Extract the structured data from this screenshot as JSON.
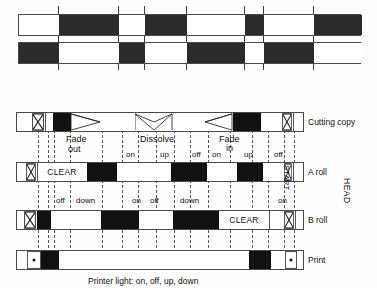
{
  "figure": {
    "caption": "Printer light: on, off, up, down",
    "head_label": "HEAD",
    "start_label": "START"
  },
  "top_strips": {
    "rule_positions": [
      58,
      118,
      144,
      186,
      244,
      263,
      313
    ],
    "strip_a": {
      "segments": [
        {
          "x": 18,
          "w": 40,
          "fill": "white"
        },
        {
          "x": 58,
          "w": 60,
          "fill": "black"
        },
        {
          "x": 118,
          "w": 26,
          "fill": "white"
        },
        {
          "x": 144,
          "w": 42,
          "fill": "black"
        },
        {
          "x": 186,
          "w": 58,
          "fill": "white"
        },
        {
          "x": 244,
          "w": 19,
          "fill": "black"
        },
        {
          "x": 263,
          "w": 50,
          "fill": "white"
        },
        {
          "x": 313,
          "w": 48,
          "fill": "black"
        }
      ]
    },
    "strip_b": {
      "segments": [
        {
          "x": 18,
          "w": 40,
          "fill": "black"
        },
        {
          "x": 58,
          "w": 60,
          "fill": "white"
        },
        {
          "x": 118,
          "w": 26,
          "fill": "black"
        },
        {
          "x": 144,
          "w": 42,
          "fill": "white"
        },
        {
          "x": 186,
          "w": 58,
          "fill": "black"
        },
        {
          "x": 244,
          "w": 19,
          "fill": "white"
        },
        {
          "x": 263,
          "w": 50,
          "fill": "black"
        },
        {
          "x": 313,
          "w": 48,
          "fill": "white"
        }
      ]
    }
  },
  "tracks": [
    {
      "id": "cutting-copy",
      "label": "Cutting copy",
      "cells": [
        {
          "x": 0,
          "w": 14,
          "fill": "white"
        },
        {
          "x": 14,
          "w": 14,
          "fill": "white",
          "marker": "x"
        },
        {
          "x": 28,
          "w": 8,
          "fill": "white"
        },
        {
          "x": 36,
          "w": 18,
          "fill": "black"
        },
        {
          "x": 54,
          "w": 30,
          "fill": "white",
          "marker": "fade-out"
        },
        {
          "x": 84,
          "w": 34,
          "fill": "white"
        },
        {
          "x": 118,
          "w": 38,
          "fill": "white",
          "marker": "dissolve"
        },
        {
          "x": 156,
          "w": 32,
          "fill": "white"
        },
        {
          "x": 188,
          "w": 28,
          "fill": "white",
          "marker": "fade-in"
        },
        {
          "x": 216,
          "w": 28,
          "fill": "black"
        },
        {
          "x": 244,
          "w": 20,
          "fill": "white"
        },
        {
          "x": 264,
          "w": 12,
          "fill": "white",
          "marker": "x"
        },
        {
          "x": 276,
          "w": 12,
          "fill": "white"
        }
      ]
    },
    {
      "id": "a-roll",
      "label": "A roll",
      "cells": [
        {
          "x": 0,
          "w": 8,
          "fill": "white"
        },
        {
          "x": 8,
          "w": 12,
          "fill": "white",
          "marker": "x"
        },
        {
          "x": 20,
          "w": 50,
          "fill": "white",
          "text": "CLEAR"
        },
        {
          "x": 70,
          "w": 30,
          "fill": "black"
        },
        {
          "x": 100,
          "w": 54,
          "fill": "white"
        },
        {
          "x": 154,
          "w": 36,
          "fill": "black"
        },
        {
          "x": 190,
          "w": 30,
          "fill": "white"
        },
        {
          "x": 220,
          "w": 26,
          "fill": "black"
        },
        {
          "x": 246,
          "w": 20,
          "fill": "white"
        },
        {
          "x": 266,
          "w": 10,
          "fill": "white",
          "marker": "x",
          "vertical_text": "START"
        },
        {
          "x": 276,
          "w": 12,
          "fill": "white"
        }
      ]
    },
    {
      "id": "b-roll",
      "label": "B roll",
      "cells": [
        {
          "x": 0,
          "w": 6,
          "fill": "white"
        },
        {
          "x": 6,
          "w": 14,
          "fill": "white",
          "marker": "x"
        },
        {
          "x": 20,
          "w": 14,
          "fill": "black"
        },
        {
          "x": 34,
          "w": 50,
          "fill": "white"
        },
        {
          "x": 84,
          "w": 38,
          "fill": "black"
        },
        {
          "x": 122,
          "w": 34,
          "fill": "white"
        },
        {
          "x": 156,
          "w": 46,
          "fill": "black"
        },
        {
          "x": 202,
          "w": 50,
          "fill": "white",
          "text": "CLEAR"
        },
        {
          "x": 252,
          "w": 14,
          "fill": "white"
        },
        {
          "x": 266,
          "w": 12,
          "fill": "white",
          "marker": "x"
        },
        {
          "x": 278,
          "w": 10,
          "fill": "white"
        }
      ]
    },
    {
      "id": "print",
      "label": "Print",
      "cells": [
        {
          "x": 0,
          "w": 10,
          "fill": "white"
        },
        {
          "x": 10,
          "w": 14,
          "fill": "white",
          "marker": "dot"
        },
        {
          "x": 24,
          "w": 18,
          "fill": "black"
        },
        {
          "x": 42,
          "w": 190,
          "fill": "white"
        },
        {
          "x": 232,
          "w": 22,
          "fill": "black"
        },
        {
          "x": 254,
          "w": 14,
          "fill": "white"
        },
        {
          "x": 268,
          "w": 12,
          "fill": "white",
          "marker": "dot"
        },
        {
          "x": 280,
          "w": 8,
          "fill": "white"
        }
      ]
    }
  ],
  "cue_lines": [
    {
      "x": 22,
      "top": 20,
      "height": 138
    },
    {
      "x": 32,
      "top": 20,
      "height": 138
    },
    {
      "x": 38,
      "top": 20,
      "height": 138
    },
    {
      "x": 54,
      "top": 20,
      "height": 138
    },
    {
      "x": 86,
      "top": 20,
      "height": 138
    },
    {
      "x": 106,
      "top": 20,
      "height": 138
    },
    {
      "x": 122,
      "top": 20,
      "height": 138
    },
    {
      "x": 140,
      "top": 20,
      "height": 138
    },
    {
      "x": 158,
      "top": 20,
      "height": 138
    },
    {
      "x": 174,
      "top": 20,
      "height": 138
    },
    {
      "x": 192,
      "top": 20,
      "height": 138
    },
    {
      "x": 214,
      "top": 20,
      "height": 138
    },
    {
      "x": 236,
      "top": 20,
      "height": 138
    },
    {
      "x": 252,
      "top": 20,
      "height": 138
    },
    {
      "x": 268,
      "top": 20,
      "height": 138
    },
    {
      "x": 278,
      "top": 20,
      "height": 138
    }
  ],
  "annotations_row1": [
    {
      "label": "Fade",
      "x": 50,
      "y": 22
    },
    {
      "label": "out",
      "x": 52,
      "y": 32
    },
    {
      "label": "Dissolve",
      "x": 124,
      "y": 22
    },
    {
      "label": "Fade",
      "x": 203,
      "y": 22
    },
    {
      "label": "in",
      "x": 210,
      "y": 31
    }
  ],
  "annotations_row2": [
    {
      "label": "on",
      "x": 110
    },
    {
      "label": "up",
      "x": 144
    },
    {
      "label": "off",
      "x": 176
    },
    {
      "label": "on",
      "x": 196
    },
    {
      "label": "up",
      "x": 228
    },
    {
      "label": "off",
      "x": 258
    }
  ],
  "annotations_row3": [
    {
      "label": "off",
      "x": 40
    },
    {
      "label": "down",
      "x": 60
    },
    {
      "label": "on",
      "x": 116
    },
    {
      "label": "off",
      "x": 134
    },
    {
      "label": "down",
      "x": 164
    },
    {
      "label": "on",
      "x": 262
    }
  ]
}
